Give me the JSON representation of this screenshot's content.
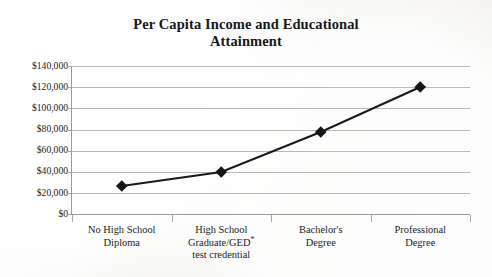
{
  "chart_data": {
    "type": "line",
    "title": "Per Capita Income and Educational Attainment",
    "title_lines": [
      "Per Capita Income and Educational",
      "Attainment"
    ],
    "categories": [
      "No High School Diploma",
      "High School Graduate/GED* test credential",
      "Bachelor's Degree",
      "Professional Degree"
    ],
    "category_lines": [
      [
        "No High School",
        "Diploma"
      ],
      [
        "High School",
        "Graduate/GED*",
        "test credential"
      ],
      [
        "Bachelor's",
        "Degree"
      ],
      [
        "Professional",
        "Degree"
      ]
    ],
    "values": [
      26500,
      40000,
      77500,
      120000
    ],
    "xlabel": "",
    "ylabel": "",
    "ylim": [
      0,
      140000
    ],
    "ytick_step": 20000,
    "ytick_labels": [
      "$140,000",
      "$120,000",
      "$100,000",
      "$80,000",
      "$60,000",
      "$40,000",
      "$20,000",
      "$0"
    ],
    "ytick_values": [
      140000,
      120000,
      100000,
      80000,
      60000,
      40000,
      20000,
      0
    ],
    "grid": true,
    "legend": false,
    "legend_position": "none",
    "series_color": "#1a1a1d",
    "gridline_color": "#b9b9b6",
    "axis_color": "#9a9a97",
    "marker": "diamond",
    "background_color": "#f7f6f4"
  }
}
